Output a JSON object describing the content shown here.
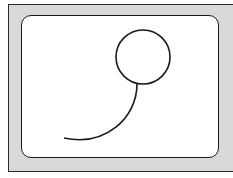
{
  "figure": {
    "colors": {
      "bezel": "#d9d9d9",
      "screen": "#ffffff",
      "stroke": "#1a1a1a"
    },
    "shapes": {
      "circle": {
        "cx": 143,
        "cy": 57,
        "r": 27
      },
      "tail": {
        "path": "M 137 84 C 137 118, 105 147, 64 138"
      }
    }
  }
}
